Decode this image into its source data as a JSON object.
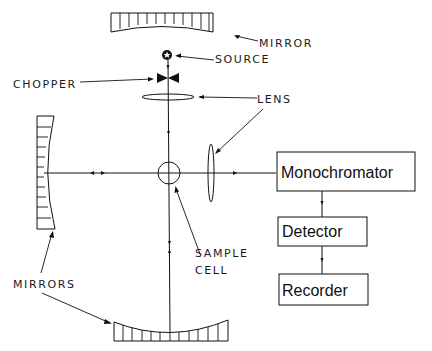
{
  "diagram": {
    "title": "",
    "labels": {
      "mirror_top": "MIRROR",
      "source": "SOURCE",
      "chopper": "CHOPPER",
      "lens": "LENS",
      "sample_line1": "SAMPLE",
      "sample_line2": "CELL",
      "mirrors": "MIRRORS"
    },
    "blocks": {
      "monochromator": "Monochromator",
      "detector": "Detector",
      "recorder": "Recorder"
    },
    "components": [
      "top-concave-mirror",
      "source",
      "chopper",
      "horizontal-lens",
      "sample-cell",
      "vertical-lens",
      "left-concave-mirror",
      "bottom-concave-mirror",
      "monochromator",
      "detector",
      "recorder"
    ],
    "flow": [
      "source -> chopper -> lens -> sample cell",
      "sample cell <-> bottom mirror",
      "sample cell <-> left mirror",
      "sample cell -> lens -> monochromator -> detector -> recorder"
    ],
    "colors": {
      "line": "#111111",
      "background": "#ffffff"
    }
  }
}
